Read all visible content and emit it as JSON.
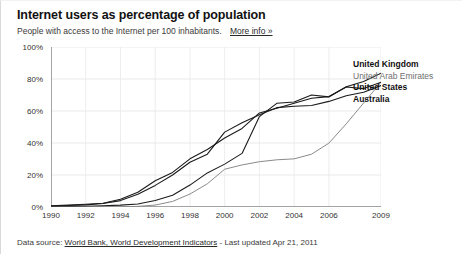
{
  "header": {
    "title": "Internet users as percentage of population",
    "subtitle": "People with access to the Internet per 100 inhabitants.",
    "more_info_label": "More info »"
  },
  "footer": {
    "prefix": "Data source:",
    "source_link": "World Bank, World Development Indicators",
    "suffix": "- Last updated Apr 21, 2011"
  },
  "legend": {
    "items": [
      {
        "label": "United Kingdom",
        "color": "#1a1a1a",
        "weight": "strong"
      },
      {
        "label": "United Arab Emirates",
        "color": "#8a8a8a",
        "weight": "light"
      },
      {
        "label": "United States",
        "color": "#1a1a1a",
        "weight": "strong"
      },
      {
        "label": "Australia",
        "color": "#1a1a1a",
        "weight": "strong"
      }
    ]
  },
  "axis": {
    "y_ticks": [
      "0%",
      "20%",
      "40%",
      "60%",
      "80%",
      "100%"
    ],
    "x_ticks": [
      "1990",
      "1992",
      "1994",
      "1996",
      "1998",
      "2000",
      "2002",
      "2004",
      "2006",
      "2009"
    ]
  },
  "chart_data": {
    "type": "line",
    "title": "Internet users as percentage of population",
    "subtitle": "People with access to the Internet per 100 inhabitants.",
    "xlabel": "",
    "ylabel": "",
    "xlim": [
      1990,
      2009
    ],
    "ylim": [
      0,
      100
    ],
    "grid": true,
    "legend_position": "right",
    "x": [
      1990,
      1991,
      1992,
      1993,
      1994,
      1995,
      1996,
      1997,
      1998,
      1999,
      2000,
      2001,
      2002,
      2003,
      2004,
      2005,
      2006,
      2007,
      2008,
      2009
    ],
    "series": [
      {
        "name": "United Kingdom",
        "color": "#1a1a1a",
        "values": [
          0.1,
          0.3,
          0.5,
          0.8,
          1.2,
          1.9,
          4.1,
          7.4,
          13.7,
          21.3,
          26.8,
          33.5,
          56.5,
          64.8,
          65.6,
          70.0,
          68.8,
          75.1,
          78.4,
          83.6
        ]
      },
      {
        "name": "United Arab Emirates",
        "color": "#8a8a8a",
        "values": [
          0.0,
          0.0,
          0.0,
          0.0,
          0.1,
          0.4,
          1.2,
          3.5,
          8.1,
          14.5,
          23.6,
          26.3,
          28.3,
          29.5,
          30.1,
          33.0,
          39.9,
          52.0,
          65.0,
          78.0
        ]
      },
      {
        "name": "United States",
        "color": "#1a1a1a",
        "values": [
          0.8,
          1.2,
          1.7,
          2.3,
          4.9,
          9.2,
          16.4,
          21.6,
          30.1,
          35.9,
          43.1,
          49.1,
          58.8,
          61.7,
          64.8,
          68.0,
          69.0,
          75.0,
          74.0,
          78.0
        ]
      },
      {
        "name": "Australia",
        "color": "#1a1a1a",
        "values": [
          0.6,
          0.9,
          1.3,
          2.2,
          4.0,
          8.0,
          13.5,
          20.0,
          28.0,
          33.0,
          46.8,
          52.7,
          57.6,
          62.1,
          63.0,
          63.4,
          66.0,
          69.5,
          71.7,
          75.9
        ]
      }
    ]
  }
}
